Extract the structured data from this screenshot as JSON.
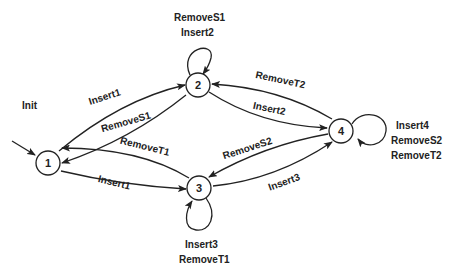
{
  "diagram": {
    "type": "state-transition-diagram",
    "nodes": [
      {
        "id": "1",
        "label": "1"
      },
      {
        "id": "2",
        "label": "2"
      },
      {
        "id": "3",
        "label": "3"
      },
      {
        "id": "4",
        "label": "4"
      }
    ],
    "initial": {
      "label": "Init",
      "target": "1"
    },
    "edges": [
      {
        "from": "1",
        "to": "2",
        "label": "Insert1"
      },
      {
        "from": "2",
        "to": "1",
        "label": "RemoveS1"
      },
      {
        "from": "2",
        "to": "2",
        "labels": [
          "RemoveS1",
          "Insert2"
        ]
      },
      {
        "from": "2",
        "to": "4",
        "label": "Insert2"
      },
      {
        "from": "4",
        "to": "2",
        "label": "RemoveT2"
      },
      {
        "from": "1",
        "to": "3",
        "label": "Insert1"
      },
      {
        "from": "3",
        "to": "1",
        "label": "RemoveT1"
      },
      {
        "from": "3",
        "to": "3",
        "labels": [
          "Insert3",
          "RemoveT1"
        ]
      },
      {
        "from": "3",
        "to": "4",
        "label": "Insert3"
      },
      {
        "from": "4",
        "to": "3",
        "label": "RemoveS2"
      },
      {
        "from": "4",
        "to": "4",
        "labels": [
          "Insert4",
          "RemoveS2",
          "RemoveT2"
        ]
      }
    ]
  },
  "labels": {
    "init": "Init",
    "n1": "1",
    "n2": "2",
    "n3": "3",
    "n4": "4",
    "e12": "Insert1",
    "e21": "RemoveS1",
    "loop2_a": "RemoveS1",
    "loop2_b": "Insert2",
    "e24": "Insert2",
    "e42": "RemoveT2",
    "e13": "Insert1",
    "e31": "RemoveT1",
    "loop3_a": "Insert3",
    "loop3_b": "RemoveT1",
    "e34": "Insert3",
    "e43": "RemoveS2",
    "loop4_a": "Insert4",
    "loop4_b": "RemoveS2",
    "loop4_c": "RemoveT2"
  }
}
